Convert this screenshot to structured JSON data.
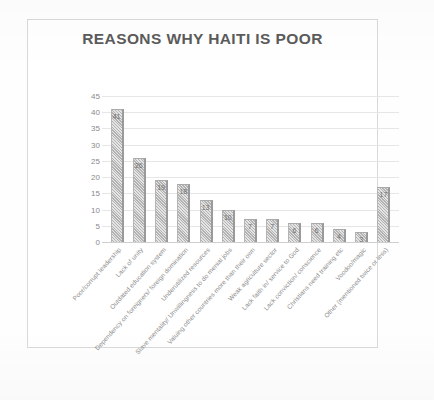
{
  "chart_data": {
    "type": "bar",
    "title": "REASONS WHY HAITI IS POOR",
    "xlabel": "",
    "ylabel": "",
    "ylim": [
      0,
      45
    ],
    "yticks": [
      0,
      5,
      10,
      15,
      20,
      25,
      30,
      35,
      40,
      45
    ],
    "grid": true,
    "legend": "none",
    "categories": [
      "Poor/corrupt leadership",
      "Lack of unity",
      "Outdated education system",
      "Dependency on foreigners/ foreign domination",
      "Underutilized resources",
      "Slave mentality/ Unwillingness to do menial jobs",
      "Valuing other countries more than their own",
      "Weak agriculture sector",
      "Lack faith in/ service to God",
      "Lack conviction/ conscience",
      "Christians need training etc",
      "Voodoo/magic",
      "Other (mentioned twice or less)"
    ],
    "values": [
      41,
      26,
      19,
      18,
      13,
      10,
      7,
      7,
      6,
      6,
      4,
      3,
      17
    ],
    "data_labels": [
      "41",
      "26",
      "19",
      "18",
      "13",
      "10",
      "7",
      "7",
      "6",
      "6",
      "4",
      "3",
      "17"
    ],
    "colors": {
      "bar_fill": "#c3c3c3",
      "bar_edge": "#9a9a9a",
      "title_text": "#5b5b5b",
      "tick_text": "#8a8a8a",
      "gridline": "#e6e6e6",
      "frame_border": "#d9d9d9",
      "background": "#ffffff"
    }
  }
}
